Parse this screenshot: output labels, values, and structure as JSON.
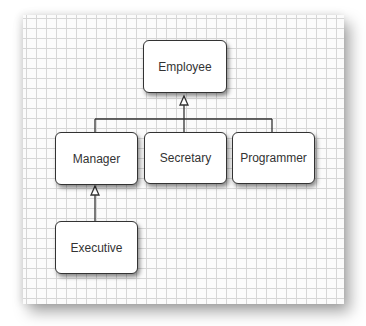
{
  "diagram": {
    "type": "uml-class-inheritance",
    "nodes": [
      {
        "id": "employee",
        "label": "Employee"
      },
      {
        "id": "manager",
        "label": "Manager"
      },
      {
        "id": "secretary",
        "label": "Secretary"
      },
      {
        "id": "programmer",
        "label": "Programmer"
      },
      {
        "id": "executive",
        "label": "Executive"
      }
    ],
    "edges": [
      {
        "from": "manager",
        "to": "employee",
        "kind": "inheritance"
      },
      {
        "from": "secretary",
        "to": "employee",
        "kind": "inheritance"
      },
      {
        "from": "programmer",
        "to": "employee",
        "kind": "inheritance"
      },
      {
        "from": "executive",
        "to": "manager",
        "kind": "inheritance"
      }
    ],
    "colors": {
      "line": "#333333",
      "box_fill": "#ffffff",
      "grid": "#d6d6d6"
    }
  }
}
